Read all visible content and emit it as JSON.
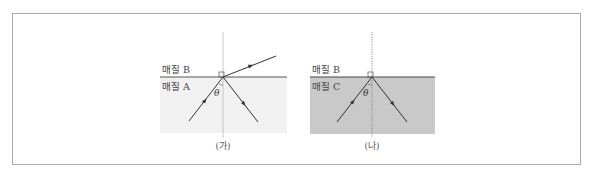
{
  "figures": [
    {
      "id": "ga",
      "caption": "(가)",
      "upper_medium": "매질 B",
      "lower_medium": "매질 A",
      "angle_label": "θ",
      "lower_fill": "#f1f1f1",
      "normal_style": "solid",
      "rays": [
        "incident",
        "reflected",
        "refracted"
      ]
    },
    {
      "id": "na",
      "caption": "(나)",
      "upper_medium": "매질 B",
      "lower_medium": "매질 C",
      "angle_label": "θ",
      "lower_fill": "#c9c9c9",
      "normal_style": "dotted",
      "rays": [
        "incident",
        "reflected"
      ]
    }
  ],
  "colors": {
    "border": "#a9a9a9",
    "line": "#555555",
    "ray": "#333333"
  }
}
